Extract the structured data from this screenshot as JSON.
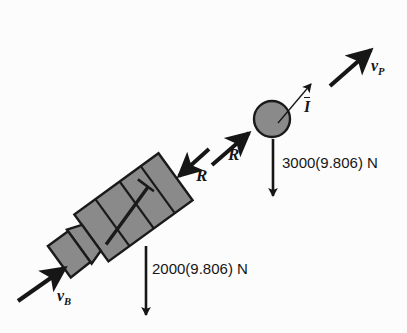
{
  "figure": {
    "width": 407,
    "height": 333,
    "background_color": "#fcfcfc",
    "ink_color": "#161616",
    "body_fill_color": "#8a8a8a",
    "body_stroke_color": "#1a1a1a"
  },
  "labels": {
    "velocity_projectile": {
      "symbol": "v",
      "subscript": "P"
    },
    "impulse": {
      "symbol": "I",
      "overbar": true
    },
    "weight_projectile": "3000(9.806) N",
    "reaction_upper": "R",
    "reaction_lower": "R",
    "weight_body": "2000(9.806) N",
    "velocity_body": {
      "symbol": "v",
      "subscript": "B"
    }
  },
  "elements": {
    "projectile_circle": {
      "name": "projectile",
      "cx": 272,
      "cy": 119,
      "r": 18
    },
    "gun_body": {
      "name": "recoiling-gun-body",
      "angle_deg": -36
    },
    "arrows": [
      {
        "name": "velocity-projectile-arrow",
        "style": "thick",
        "from": [
          330,
          86
        ],
        "to": [
          374,
          47
        ]
      },
      {
        "name": "impulse-arrow",
        "style": "thin",
        "from": [
          277,
          123
        ],
        "to": [
          314,
          80
        ]
      },
      {
        "name": "weight-projectile-arrow",
        "style": "thin",
        "from": [
          273,
          139
        ],
        "to": [
          273,
          203
        ]
      },
      {
        "name": "reaction-upper-arrow",
        "style": "thick",
        "from": [
          211,
          166
        ],
        "to": [
          251,
          131
        ]
      },
      {
        "name": "reaction-lower-arrow",
        "style": "thick",
        "from": [
          210,
          148
        ],
        "to": [
          176,
          178
        ]
      },
      {
        "name": "weight-body-arrow",
        "style": "thin",
        "from": [
          146,
          246
        ],
        "to": [
          146,
          322
        ]
      },
      {
        "name": "velocity-body-arrow",
        "style": "thick",
        "from": [
          18,
          301
        ],
        "to": [
          68,
          265
        ]
      }
    ]
  }
}
